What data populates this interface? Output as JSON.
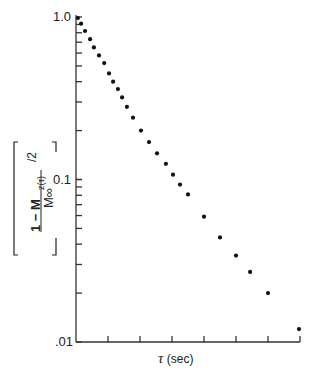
{
  "chart_data": {
    "type": "scatter",
    "title": "",
    "xlabel": "τ (sec)",
    "ylabel": "[1 − Mz(τ)/M∞]/2",
    "yscale": "log",
    "ylim": [
      0.01,
      1.0
    ],
    "yticks_labeled": [
      "1.0",
      "0.1",
      ".01"
    ],
    "x_tick_count": 7,
    "x_tick_labels": [],
    "grid": false,
    "legend": null,
    "points_x_units_of_tick": [
      0.06,
      0.16,
      0.28,
      0.44,
      0.56,
      0.72,
      0.88,
      1.03,
      1.16,
      1.31,
      1.44,
      1.59,
      1.78,
      2.03,
      2.28,
      2.53,
      2.81,
      3.03,
      3.25,
      3.5,
      4.0,
      4.5,
      5.0,
      5.44,
      6.0,
      6.97
    ],
    "points_y": [
      0.986,
      0.91,
      0.82,
      0.73,
      0.65,
      0.58,
      0.52,
      0.45,
      0.4,
      0.36,
      0.32,
      0.28,
      0.24,
      0.2,
      0.17,
      0.145,
      0.125,
      0.107,
      0.093,
      0.081,
      0.059,
      0.044,
      0.034,
      0.027,
      0.02,
      0.012
    ]
  },
  "axes": {
    "y_label_1": "1.0",
    "y_label_01": "0.1",
    "y_label_001": ".01",
    "x_label_symbol": "τ",
    "x_label_unit": "(sec)"
  }
}
